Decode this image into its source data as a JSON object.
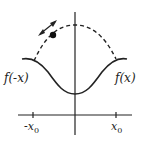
{
  "diagram": {
    "labels": {
      "left_function": "f(-x)",
      "right_function": "f(x)",
      "neg_tick": "-x",
      "neg_tick_sub": "0",
      "pos_tick": "x",
      "pos_tick_sub": "0"
    },
    "colors": {
      "stroke": "#222222",
      "background": "#ffffff"
    }
  }
}
